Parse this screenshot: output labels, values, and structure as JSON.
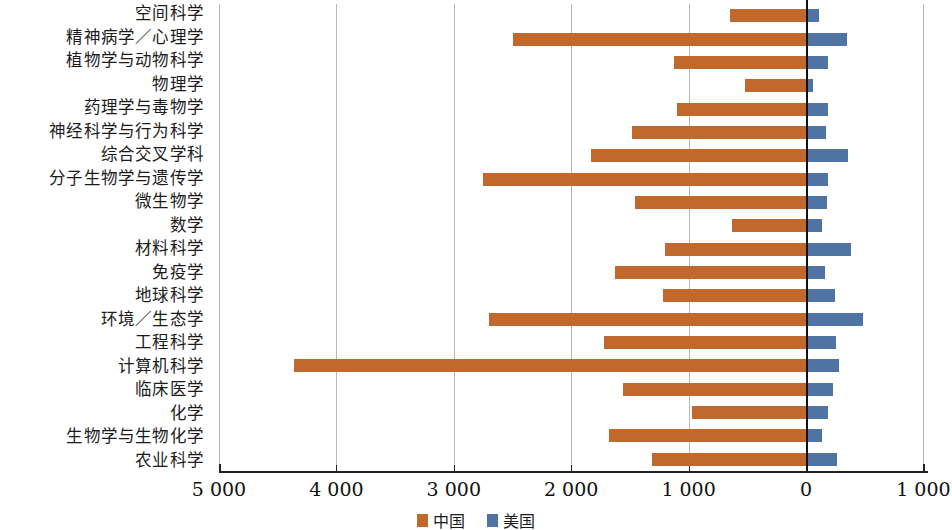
{
  "chart_data": {
    "type": "bar",
    "orientation": "horizontal-diverging-left",
    "title": "",
    "subtitle": "",
    "xlabel": "",
    "ylabel": "",
    "grid": true,
    "legend_position": "bottom-center",
    "xaxis": {
      "tick_labels": [
        "5 000",
        "4 000",
        "3 000",
        "2 000",
        "1 000",
        "0",
        "1 000"
      ],
      "tick_values": [
        -5000,
        -4000,
        -3000,
        -2000,
        -1000,
        0,
        1000
      ],
      "xlim": [
        -5000,
        1000
      ],
      "note": "values left of zero are plotted leftward, values right of zero plotted rightward"
    },
    "series": [
      {
        "name": "中国",
        "color": "#c1682c",
        "direction": "left",
        "values": [
          647,
          2496,
          1124,
          520,
          1099,
          1482,
          1831,
          2751,
          1456,
          630,
          1201,
          1627,
          1218,
          2700,
          1721,
          4362,
          1559,
          971,
          1678,
          1312
        ]
      },
      {
        "name": "美国",
        "color": "#4f74a3",
        "direction": "right",
        "values": [
          111,
          349,
          187,
          60,
          187,
          170,
          358,
          187,
          179,
          136,
          383,
          162,
          247,
          485,
          255,
          281,
          230,
          187,
          136,
          264
        ]
      }
    ],
    "categories": [
      "空间科学",
      "精神病学／心理学",
      "植物学与动物科学",
      "物理学",
      "药理学与毒物学",
      "神经科学与行为科学",
      "综合交叉学科",
      "分子生物学与遗传学",
      "微生物学",
      "数学",
      "材料科学",
      "免疫学",
      "地球科学",
      "环境／生态学",
      "工程科学",
      "计算机科学",
      "临床医学",
      "化学",
      "生物学与生物化学",
      "农业科学"
    ]
  },
  "legend": {
    "items": [
      {
        "label": "中国",
        "color": "#c1682c"
      },
      {
        "label": "美国",
        "color": "#4f74a3"
      }
    ]
  },
  "colors": {
    "china_orange": "#c1682c",
    "usa_blue": "#4f74a3",
    "gridline": "#b8b8b8",
    "axis": "#222222",
    "zero_axis": "#111111",
    "background": "#ffffff"
  }
}
